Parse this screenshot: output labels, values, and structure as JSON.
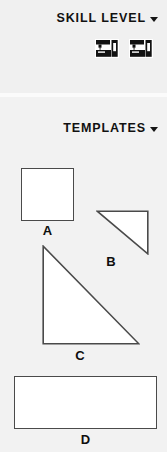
{
  "sections": [
    {
      "id": "skill-level",
      "title": "SKILL LEVEL",
      "caret_icon": "chevron-down-icon",
      "items": [
        {
          "icon": "sewing-machine-icon",
          "label": ""
        },
        {
          "icon": "sewing-machine-icon",
          "label": ""
        }
      ]
    },
    {
      "id": "templates",
      "title": "TEMPLATES",
      "caret_icon": "chevron-down-icon",
      "shapes": [
        {
          "id": "a",
          "label": "A",
          "kind": "square"
        },
        {
          "id": "b",
          "label": "B",
          "kind": "right-triangle"
        },
        {
          "id": "c",
          "label": "C",
          "kind": "right-triangle"
        },
        {
          "id": "d",
          "label": "D",
          "kind": "rectangle"
        }
      ]
    }
  ],
  "colors": {
    "background": "#f1f1f1",
    "panel_light": "#f2f2f2",
    "shape_fill": "#ffffff",
    "shape_stroke": "#4a4a4a",
    "text": "#111111"
  }
}
